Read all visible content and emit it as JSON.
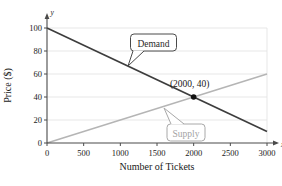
{
  "figure": {
    "background": "#ffffff"
  },
  "chart_data": {
    "type": "line",
    "title": "",
    "xlabel": "Number of Tickets",
    "ylabel": "Price ($)",
    "x_axis_end_label": "x",
    "y_axis_end_label": "y",
    "xlim": [
      0,
      3000
    ],
    "ylim": [
      0,
      100
    ],
    "x_ticks": [
      0,
      500,
      1000,
      1500,
      2000,
      2500,
      3000
    ],
    "y_ticks": [
      0,
      20,
      40,
      60,
      80,
      100
    ],
    "grid": "horizontal",
    "legend_position": "inline-callouts",
    "series": [
      {
        "name": "Demand",
        "x": [
          0,
          3000
        ],
        "y": [
          100,
          10
        ],
        "color": "#3d3d3d",
        "callout_text": "Demand",
        "callout_border_color": "#4a4a4a",
        "callout_text_color": "#2a2a2a"
      },
      {
        "name": "Supply",
        "x": [
          0,
          3000
        ],
        "y": [
          0,
          60
        ],
        "color": "#b5b5b5",
        "callout_text": "Supply",
        "callout_border_color": "#a8a8a8",
        "callout_text_color": "#a3a3a3"
      }
    ],
    "equilibrium": {
      "x": 2000,
      "y": 40,
      "label": "(2000, 40)",
      "dot_color": "#111111"
    },
    "colors": {
      "grid": "#e4e4e4",
      "axis": "#4a4a4a",
      "tick_text": "#1a1a1a"
    }
  }
}
